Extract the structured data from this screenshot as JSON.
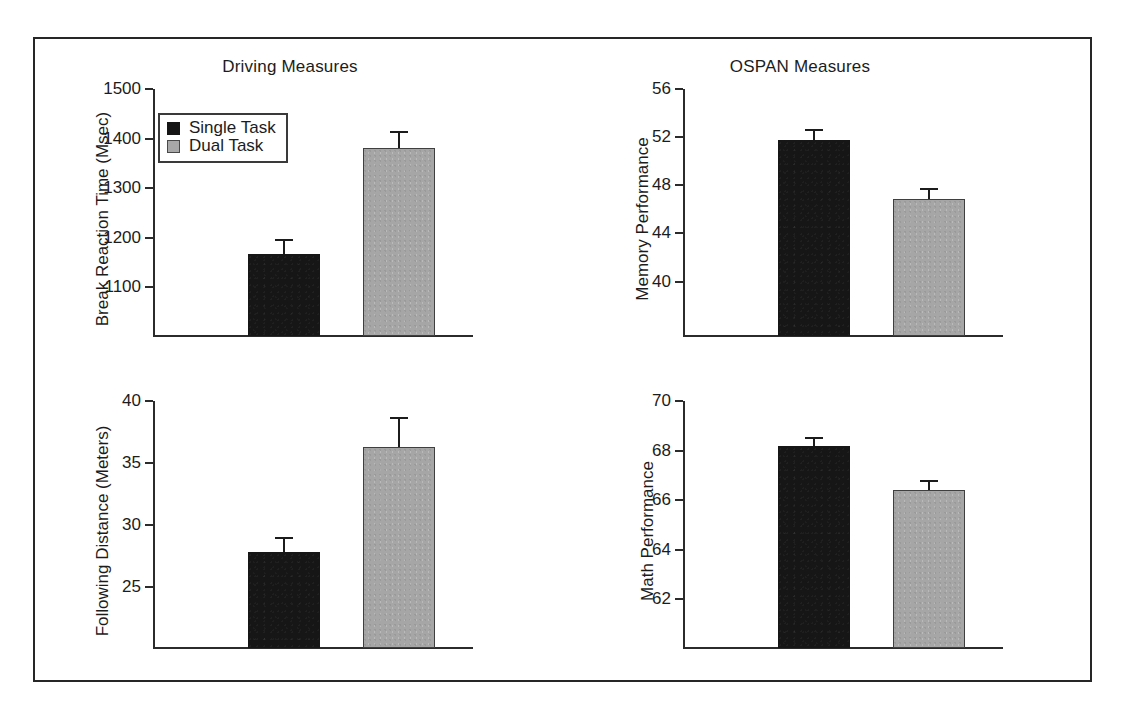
{
  "figure": {
    "legend": {
      "entries": [
        {
          "label": "Single Task",
          "color": "#151515",
          "swatch": "single-task-swatch"
        },
        {
          "label": "Dual Task",
          "color": "#a8a8a8",
          "swatch": "dual-task-swatch"
        }
      ]
    }
  },
  "chart_data": [
    {
      "id": "break-reaction-time",
      "type": "bar",
      "title": "Driving Measures",
      "xlabel": "",
      "ylabel": "Break Reaction Time (Msec)",
      "categories": [
        "Single Task",
        "Dual Task"
      ],
      "values": [
        1168,
        1382
      ],
      "errors": [
        30,
        33
      ],
      "yticks": [
        1100,
        1200,
        1300,
        1400,
        1500
      ],
      "ytick_labels": [
        "1100",
        "1200",
        "1300",
        "1400",
        "1500"
      ],
      "ylim": [
        1000,
        1500
      ],
      "grid": false,
      "legend_position": "upper left",
      "series": [
        {
          "name": "Single Task",
          "value": 1168,
          "error": 30,
          "color": "#151515"
        },
        {
          "name": "Dual Task",
          "value": 1382,
          "error": 33,
          "color": "#a8a8a8"
        }
      ]
    },
    {
      "id": "memory-performance",
      "type": "bar",
      "title": "OSPAN Measures",
      "xlabel": "",
      "ylabel": "Memory Performance",
      "categories": [
        "Single Task",
        "Dual Task"
      ],
      "values": [
        51.8,
        46.9
      ],
      "errors": [
        0.9,
        0.9
      ],
      "yticks": [
        40,
        44,
        48,
        52,
        56
      ],
      "ytick_labels": [
        "40",
        "44",
        "48",
        "52",
        "56"
      ],
      "ylim": [
        35.4,
        56
      ],
      "grid": false,
      "legend_position": "none",
      "series": [
        {
          "name": "Single Task",
          "value": 51.8,
          "error": 0.9,
          "color": "#151515"
        },
        {
          "name": "Dual Task",
          "value": 46.9,
          "error": 0.9,
          "color": "#a8a8a8"
        }
      ]
    },
    {
      "id": "following-distance",
      "type": "bar",
      "title": "",
      "xlabel": "",
      "ylabel": "Following Distance (Meters)",
      "categories": [
        "Single Task",
        "Dual Task"
      ],
      "values": [
        27.8,
        36.3
      ],
      "errors": [
        1.2,
        2.4
      ],
      "yticks": [
        25,
        30,
        35,
        40
      ],
      "ytick_labels": [
        "25",
        "30",
        "35",
        "40"
      ],
      "ylim": [
        20.0,
        40
      ],
      "grid": false,
      "legend_position": "none",
      "series": [
        {
          "name": "Single Task",
          "value": 27.8,
          "error": 1.2,
          "color": "#151515"
        },
        {
          "name": "Dual Task",
          "value": 36.3,
          "error": 2.4,
          "color": "#a8a8a8"
        }
      ]
    },
    {
      "id": "math-performance",
      "type": "bar",
      "title": "",
      "xlabel": "",
      "ylabel": "Math Performance",
      "categories": [
        "Single Task",
        "Dual Task"
      ],
      "values": [
        68.2,
        66.4
      ],
      "errors": [
        0.35,
        0.4
      ],
      "yticks": [
        62,
        64,
        66,
        68,
        70
      ],
      "ytick_labels": [
        "62",
        "64",
        "66",
        "68",
        "70"
      ],
      "ylim": [
        60.0,
        70
      ],
      "grid": false,
      "legend_position": "none",
      "series": [
        {
          "name": "Single Task",
          "value": 68.2,
          "error": 0.35,
          "color": "#151515"
        },
        {
          "name": "Dual Task",
          "value": 66.4,
          "error": 0.4,
          "color": "#a8a8a8"
        }
      ]
    }
  ]
}
